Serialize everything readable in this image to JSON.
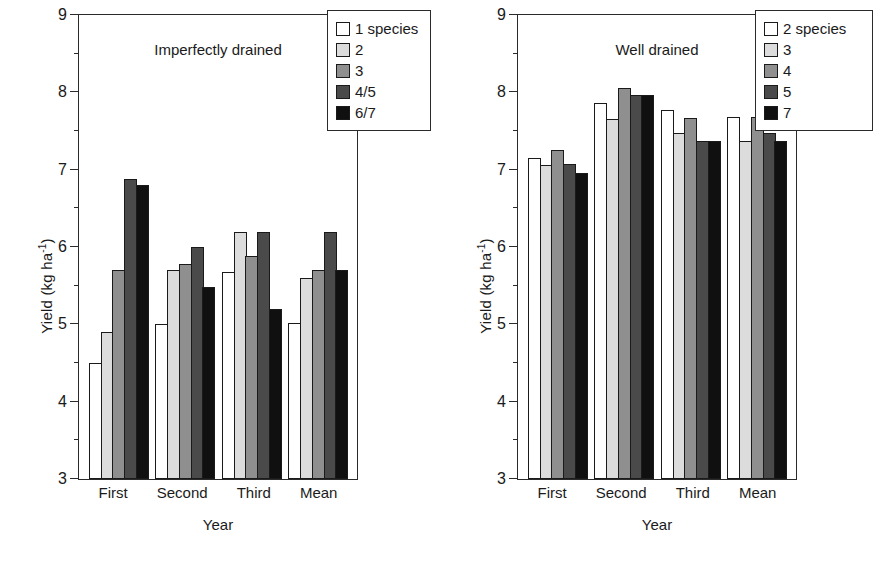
{
  "chart_data": [
    {
      "type": "bar",
      "title": "Imperfectly drained",
      "xlabel": "Year",
      "ylabel": "Yield (kg ha-1)",
      "ylabel_base": "Yield (kg ha",
      "ylabel_exp": "-1",
      "ylabel_close": ")",
      "ylim": [
        3,
        9
      ],
      "yticks": [
        3,
        4,
        5,
        6,
        7,
        8,
        9
      ],
      "yticklabels": [
        "3",
        "4",
        "5",
        "6",
        "7",
        "8",
        "9"
      ],
      "yminor": [
        3.5,
        4.5,
        5.5,
        6.5,
        7.5,
        8.5
      ],
      "grid": false,
      "legend_position": "upper-right-outside",
      "categories": [
        "First",
        "Second",
        "Third",
        "Mean"
      ],
      "series": [
        {
          "name": "1 species",
          "swatch": "white",
          "values": [
            4.5,
            5.0,
            5.68,
            5.02
          ]
        },
        {
          "name": "2",
          "swatch": "light-gray",
          "values": [
            4.9,
            5.7,
            6.2,
            5.6
          ]
        },
        {
          "name": "3",
          "swatch": "mid-gray",
          "values": [
            5.7,
            5.78,
            5.88,
            5.7
          ]
        },
        {
          "name": "4/5",
          "swatch": "dark-gray",
          "values": [
            6.88,
            6.0,
            6.2,
            6.2
          ]
        },
        {
          "name": "6/7",
          "swatch": "black",
          "values": [
            6.8,
            5.48,
            5.2,
            5.7
          ]
        }
      ]
    },
    {
      "type": "bar",
      "title": "Well drained",
      "xlabel": "Year",
      "ylabel": "Yield (kg ha-1)",
      "ylabel_base": "Yield (kg ha",
      "ylabel_exp": "-1",
      "ylabel_close": ")",
      "ylim": [
        3,
        9
      ],
      "yticks": [
        3,
        4,
        5,
        6,
        7,
        8,
        9
      ],
      "yticklabels": [
        "3",
        "4",
        "5",
        "6",
        "7",
        "8",
        "9"
      ],
      "yminor": [
        3.5,
        4.5,
        5.5,
        6.5,
        7.5,
        8.5
      ],
      "grid": false,
      "legend_position": "upper-right-outside",
      "categories": [
        "First",
        "Second",
        "Third",
        "Mean"
      ],
      "series": [
        {
          "name": "2 species",
          "swatch": "white",
          "values": [
            7.15,
            7.86,
            7.77,
            7.68
          ]
        },
        {
          "name": "3",
          "swatch": "light-gray",
          "values": [
            7.06,
            7.66,
            7.47,
            7.37
          ]
        },
        {
          "name": "4",
          "swatch": "mid-gray",
          "values": [
            7.25,
            8.06,
            7.67,
            7.68
          ]
        },
        {
          "name": "5",
          "swatch": "dark-gray",
          "values": [
            7.07,
            7.97,
            7.37,
            7.47
          ]
        },
        {
          "name": "7",
          "swatch": "black",
          "values": [
            6.96,
            7.97,
            7.37,
            7.37
          ]
        }
      ]
    }
  ],
  "colors": {
    "axis": "#2b2b2b",
    "text": "#1a1a1a",
    "swatch_white": "#ffffff",
    "swatch_light_gray": "#dcdcdc",
    "swatch_mid_gray": "#8f8f8f",
    "swatch_dark_gray": "#4a4a4a",
    "swatch_black": "#101010"
  }
}
